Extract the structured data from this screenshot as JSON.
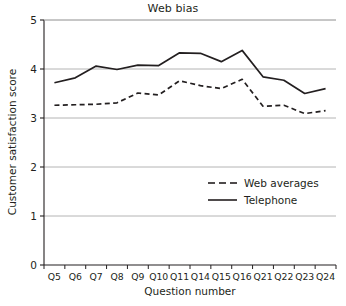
{
  "chart_data": {
    "type": "line",
    "title": "Web bias",
    "xlabel": "Question number",
    "ylabel": "Customer satisfaction score",
    "categories": [
      "Q5",
      "Q6",
      "Q7",
      "Q8",
      "Q9",
      "Q10",
      "Q11",
      "Q14",
      "Q15",
      "Q16",
      "Q21",
      "Q22",
      "Q23",
      "Q24"
    ],
    "ylim": [
      0,
      5
    ],
    "yticks": [
      0,
      1,
      2,
      3,
      4,
      5
    ],
    "ytick_labels": [
      "0",
      "1",
      "2",
      "3",
      "4",
      "5"
    ],
    "grid": true,
    "grid_axis": "y",
    "legend_position": "inside-right-middle",
    "series": [
      {
        "name": "Web averages",
        "style": "dashed",
        "color": "#231f20",
        "values": [
          3.26,
          3.27,
          3.28,
          3.31,
          3.51,
          3.47,
          3.76,
          3.66,
          3.6,
          3.79,
          3.24,
          3.26,
          3.09,
          3.15
        ]
      },
      {
        "name": "Telephone",
        "style": "solid",
        "color": "#231f20",
        "values": [
          3.72,
          3.82,
          4.06,
          3.99,
          4.08,
          4.07,
          4.33,
          4.32,
          4.15,
          4.38,
          3.84,
          3.77,
          3.5,
          3.6
        ]
      }
    ]
  },
  "colors": {
    "ink": "#231f20",
    "grid": "#b4b4b4",
    "axis": "#231f20",
    "background": "#ffffff"
  },
  "legend": {
    "items": [
      {
        "label": "Web averages",
        "style": "dashed"
      },
      {
        "label": "Telephone",
        "style": "solid"
      }
    ]
  }
}
